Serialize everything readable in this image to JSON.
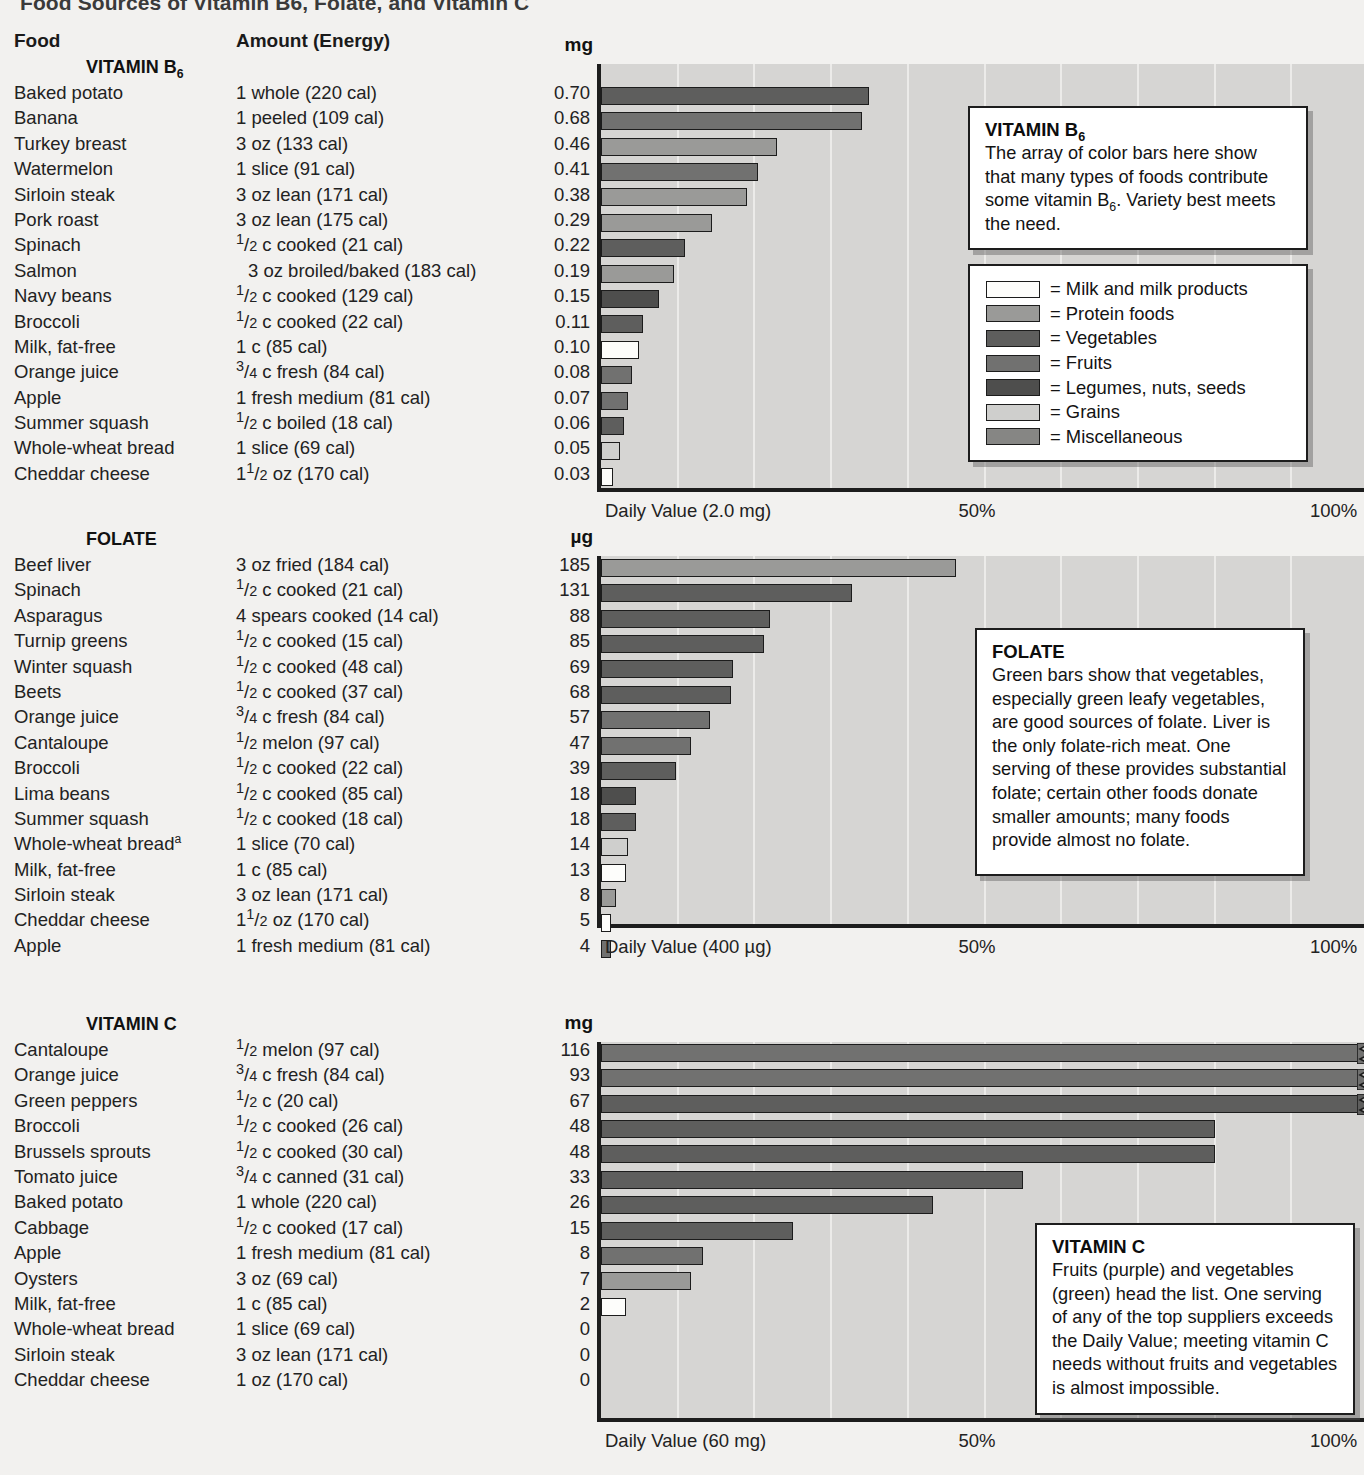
{
  "title": "Food Sources of Vitamin B6, Folate, and Vitamin C",
  "columns": {
    "food": "Food",
    "amount": "Amount (Energy)"
  },
  "colors": {
    "milk": "#fdfdfb",
    "protein": "#9a9a98",
    "vegetables": "#5e5e5d",
    "fruits": "#717170",
    "legumes": "#4e4e4d",
    "grains": "#cfcfcd",
    "misc": "#868684",
    "plot_bg": "#d6d5d3",
    "grid": "#ecebe9",
    "axis": "#1d1d1d"
  },
  "legend": {
    "items": [
      {
        "key": "milk",
        "label": "= Milk and milk products"
      },
      {
        "key": "protein",
        "label": "= Protein foods"
      },
      {
        "key": "vegetables",
        "label": "= Vegetables"
      },
      {
        "key": "fruits",
        "label": "= Fruits"
      },
      {
        "key": "legumes",
        "label": "= Legumes, nuts, seeds"
      },
      {
        "key": "grains",
        "label": "= Grains"
      },
      {
        "key": "misc",
        "label": "= Miscellaneous"
      }
    ]
  },
  "sections": [
    {
      "id": "b6",
      "group_title": "VITAMIN B6",
      "group_title_html": "VITAMIN B<sub>6</sub>",
      "unit": "mg",
      "daily_value_label": "Daily Value (2.0 mg)",
      "mid_label": "50%",
      "end_label": "100%",
      "callout": {
        "heading": "VITAMIN B6",
        "heading_html": "VITAMIN B<sub>6</sub>",
        "body": "The array of color bars here show that many types of foods contribute some vitamin B6. Variety best meets the need.",
        "body_html": "The array of color bars here show that many types of foods contribute some vitamin B<sub>6</sub>. Variety best meets the need."
      },
      "rows": [
        {
          "food": "Baked potato",
          "amount": "1 whole (220 cal)",
          "amount_html": "1 whole (220 cal)",
          "value": "0.70",
          "pct": 35.0,
          "cat": "vegetables"
        },
        {
          "food": "Banana",
          "amount": "1 peeled (109 cal)",
          "amount_html": "1 peeled (109 cal)",
          "value": "0.68",
          "pct": 34.0,
          "cat": "fruits"
        },
        {
          "food": "Turkey breast",
          "amount": "3 oz (133 cal)",
          "amount_html": "3 oz (133 cal)",
          "value": "0.46",
          "pct": 23.0,
          "cat": "protein"
        },
        {
          "food": "Watermelon",
          "amount": "1 slice (91 cal)",
          "amount_html": "1 slice (91 cal)",
          "value": "0.41",
          "pct": 20.5,
          "cat": "fruits"
        },
        {
          "food": "Sirloin steak",
          "amount": "3 oz lean (171 cal)",
          "amount_html": "3 oz lean (171 cal)",
          "value": "0.38",
          "pct": 19.0,
          "cat": "protein"
        },
        {
          "food": "Pork roast",
          "amount": "3 oz lean (175 cal)",
          "amount_html": "3 oz lean (175 cal)",
          "value": "0.29",
          "pct": 14.5,
          "cat": "protein"
        },
        {
          "food": "Spinach",
          "amount": "1/2 c cooked (21 cal)",
          "amount_html": "<span class=\"frac\"><span class=\"n\">1</span>/<span class=\"d\">2</span></span> c cooked (21 cal)",
          "value": "0.22",
          "pct": 11.0,
          "cat": "vegetables"
        },
        {
          "food": "Salmon",
          "amount": "3 oz broiled/baked (183 cal)",
          "amount_html": "3 oz broiled/baked (183 cal)",
          "indent": true,
          "value": "0.19",
          "pct": 9.5,
          "cat": "protein"
        },
        {
          "food": "Navy beans",
          "amount": "1/2 c cooked (129 cal)",
          "amount_html": "<span class=\"frac\"><span class=\"n\">1</span>/<span class=\"d\">2</span></span> c cooked (129 cal)",
          "value": "0.15",
          "pct": 7.5,
          "cat": "legumes"
        },
        {
          "food": "Broccoli",
          "amount": "1/2 c cooked (22 cal)",
          "amount_html": "<span class=\"frac\"><span class=\"n\">1</span>/<span class=\"d\">2</span></span> c cooked (22 cal)",
          "value": "0.11",
          "pct": 5.5,
          "cat": "vegetables"
        },
        {
          "food": "Milk, fat-free",
          "amount": "1 c (85 cal)",
          "amount_html": "1 c (85 cal)",
          "value": "0.10",
          "pct": 5.0,
          "cat": "milk"
        },
        {
          "food": "Orange juice",
          "amount": "3/4 c fresh (84 cal)",
          "amount_html": "<span class=\"frac\"><span class=\"n\">3</span>/<span class=\"d\">4</span></span> c fresh (84 cal)",
          "value": "0.08",
          "pct": 4.0,
          "cat": "fruits"
        },
        {
          "food": "Apple",
          "amount": "1 fresh medium (81 cal)",
          "amount_html": "1 fresh medium (81 cal)",
          "value": "0.07",
          "pct": 3.5,
          "cat": "fruits"
        },
        {
          "food": "Summer squash",
          "amount": "1/2 c boiled (18 cal)",
          "amount_html": "<span class=\"frac\"><span class=\"n\">1</span>/<span class=\"d\">2</span></span> c boiled (18 cal)",
          "value": "0.06",
          "pct": 3.0,
          "cat": "vegetables"
        },
        {
          "food": "Whole-wheat bread",
          "amount": "1 slice (69 cal)",
          "amount_html": "1 slice (69 cal)",
          "value": "0.05",
          "pct": 2.5,
          "cat": "grains"
        },
        {
          "food": "Cheddar cheese",
          "amount": "1 1/2 oz (170 cal)",
          "amount_html": "1<span class=\"frac\"><span class=\"n\">1</span>/<span class=\"d\">2</span></span> oz (170 cal)",
          "value": "0.03",
          "pct": 1.5,
          "cat": "milk"
        }
      ]
    },
    {
      "id": "folate",
      "group_title": "FOLATE",
      "group_title_html": "FOLATE",
      "unit": "µg",
      "daily_value_label": "Daily Value (400 µg)",
      "mid_label": "50%",
      "end_label": "100%",
      "callout": {
        "heading": "FOLATE",
        "heading_html": "FOLATE",
        "body": "Green bars show that vegetables, especially green leafy vegetables, are good sources of folate. Liver is the only folate-rich meat. One serving of these provides substantial folate; certain other foods donate smaller amounts; many foods provide almost no folate.",
        "body_html": "Green bars show that vegetables, especially green leafy vegetables, are good sources of folate. Liver is the only folate-rich meat. One serving of these provides substantial folate; certain other foods donate smaller amounts; many foods provide almost no folate."
      },
      "rows": [
        {
          "food": "Beef liver",
          "amount": "3 oz fried (184 cal)",
          "amount_html": "3 oz fried (184 cal)",
          "value": "185",
          "pct": 46.25,
          "cat": "protein"
        },
        {
          "food": "Spinach",
          "amount": "1/2 c cooked (21 cal)",
          "amount_html": "<span class=\"frac\"><span class=\"n\">1</span>/<span class=\"d\">2</span></span> c cooked (21 cal)",
          "value": "131",
          "pct": 32.75,
          "cat": "vegetables"
        },
        {
          "food": "Asparagus",
          "amount": "4 spears cooked (14 cal)",
          "amount_html": "4 spears cooked (14 cal)",
          "value": "88",
          "pct": 22.0,
          "cat": "vegetables"
        },
        {
          "food": "Turnip greens",
          "amount": "1/2 c cooked (15 cal)",
          "amount_html": "<span class=\"frac\"><span class=\"n\">1</span>/<span class=\"d\">2</span></span> c cooked (15 cal)",
          "value": "85",
          "pct": 21.25,
          "cat": "vegetables"
        },
        {
          "food": "Winter squash",
          "amount": "1/2 c cooked (48 cal)",
          "amount_html": "<span class=\"frac\"><span class=\"n\">1</span>/<span class=\"d\">2</span></span> c cooked (48 cal)",
          "value": "69",
          "pct": 17.25,
          "cat": "vegetables"
        },
        {
          "food": "Beets",
          "amount": "1/2 c cooked (37 cal)",
          "amount_html": "<span class=\"frac\"><span class=\"n\">1</span>/<span class=\"d\">2</span></span> c cooked (37 cal)",
          "value": "68",
          "pct": 17.0,
          "cat": "vegetables"
        },
        {
          "food": "Orange juice",
          "amount": "3/4 c fresh (84 cal)",
          "amount_html": "<span class=\"frac\"><span class=\"n\">3</span>/<span class=\"d\">4</span></span> c fresh (84 cal)",
          "value": "57",
          "pct": 14.25,
          "cat": "fruits"
        },
        {
          "food": "Cantaloupe",
          "amount": "1/2 melon (97 cal)",
          "amount_html": "<span class=\"frac\"><span class=\"n\">1</span>/<span class=\"d\">2</span></span> melon (97 cal)",
          "value": "47",
          "pct": 11.75,
          "cat": "fruits"
        },
        {
          "food": "Broccoli",
          "amount": "1/2 c cooked (22 cal)",
          "amount_html": "<span class=\"frac\"><span class=\"n\">1</span>/<span class=\"d\">2</span></span> c cooked (22 cal)",
          "value": "39",
          "pct": 9.75,
          "cat": "vegetables"
        },
        {
          "food": "Lima beans",
          "amount": "1/2 c cooked (85 cal)",
          "amount_html": "<span class=\"frac\"><span class=\"n\">1</span>/<span class=\"d\">2</span></span> c cooked (85 cal)",
          "value": "18",
          "pct": 4.5,
          "cat": "legumes"
        },
        {
          "food": "Summer squash",
          "amount": "1/2 c cooked (18 cal)",
          "amount_html": "<span class=\"frac\"><span class=\"n\">1</span>/<span class=\"d\">2</span></span> c cooked (18 cal)",
          "value": "18",
          "pct": 4.5,
          "cat": "vegetables"
        },
        {
          "food": "Whole-wheat bread",
          "food_html": "Whole-wheat bread<sup>a</sup>",
          "amount": "1 slice (70 cal)",
          "amount_html": "1 slice (70 cal)",
          "value": "14",
          "pct": 3.5,
          "cat": "grains"
        },
        {
          "food": "Milk, fat-free",
          "amount": "1 c (85 cal)",
          "amount_html": "1 c (85 cal)",
          "value": "13",
          "pct": 3.25,
          "cat": "milk"
        },
        {
          "food": "Sirloin steak",
          "amount": "3 oz lean (171 cal)",
          "amount_html": "3 oz lean (171 cal)",
          "value": "8",
          "pct": 2.0,
          "cat": "protein"
        },
        {
          "food": "Cheddar cheese",
          "amount": "1 1/2 oz (170 cal)",
          "amount_html": "1<span class=\"frac\"><span class=\"n\">1</span>/<span class=\"d\">2</span></span> oz (170 cal)",
          "value": "5",
          "pct": 1.25,
          "cat": "milk"
        },
        {
          "food": "Apple",
          "amount": "1 fresh medium (81 cal)",
          "amount_html": "1 fresh medium (81 cal)",
          "value": "4",
          "pct": 1.0,
          "cat": "fruits"
        }
      ]
    },
    {
      "id": "vitc",
      "group_title": "VITAMIN C",
      "group_title_html": "VITAMIN C",
      "unit": "mg",
      "daily_value_label": "Daily Value (60 mg)",
      "mid_label": "50%",
      "end_label": "100%",
      "callout": {
        "heading": "VITAMIN C",
        "heading_html": "VITAMIN C",
        "body": "Fruits (purple) and vegetables (green) head the list. One serving of any of the top suppliers exceeds the Daily Value; meeting vitamin C needs without fruits and vegetables is almost impossible.",
        "body_html": "Fruits (purple) and vegetables (green) head the list. One serving of any of the top suppliers exceeds the Daily Value; meeting vitamin C needs without fruits and vegetables is almost impossible."
      },
      "rows": [
        {
          "food": "Cantaloupe",
          "amount": "1/2 melon (97 cal)",
          "amount_html": "<span class=\"frac\"><span class=\"n\">1</span>/<span class=\"d\">2</span></span> melon (97 cal)",
          "value": "116",
          "pct": 104,
          "cat": "fruits",
          "broken": true
        },
        {
          "food": "Orange juice",
          "amount": "3/4 c fresh (84 cal)",
          "amount_html": "<span class=\"frac\"><span class=\"n\">3</span>/<span class=\"d\">4</span></span> c fresh (84 cal)",
          "value": "93",
          "pct": 104,
          "cat": "fruits",
          "broken": true
        },
        {
          "food": "Green peppers",
          "amount": "1/2 c (20 cal)",
          "amount_html": "<span class=\"frac\"><span class=\"n\">1</span>/<span class=\"d\">2</span></span> c (20 cal)",
          "value": "67",
          "pct": 104,
          "cat": "vegetables",
          "broken": true
        },
        {
          "food": "Broccoli",
          "amount": "1/2 c cooked (26 cal)",
          "amount_html": "<span class=\"frac\"><span class=\"n\">1</span>/<span class=\"d\">2</span></span> c cooked (26 cal)",
          "value": "48",
          "pct": 80.0,
          "cat": "vegetables"
        },
        {
          "food": "Brussels sprouts",
          "amount": "1/2 c cooked (30 cal)",
          "amount_html": "<span class=\"frac\"><span class=\"n\">1</span>/<span class=\"d\">2</span></span> c cooked (30 cal)",
          "value": "48",
          "pct": 80.0,
          "cat": "vegetables"
        },
        {
          "food": "Tomato  juice",
          "amount": "3/4 c canned (31 cal)",
          "amount_html": "<span class=\"frac\"><span class=\"n\">3</span>/<span class=\"d\">4</span></span> c canned (31 cal)",
          "value": "33",
          "pct": 55.0,
          "cat": "vegetables"
        },
        {
          "food": "Baked potato",
          "amount": "1 whole (220 cal)",
          "amount_html": "1 whole (220 cal)",
          "value": "26",
          "pct": 43.3,
          "cat": "vegetables"
        },
        {
          "food": "Cabbage",
          "amount": "1/2 c cooked (17 cal)",
          "amount_html": "<span class=\"frac\"><span class=\"n\">1</span>/<span class=\"d\">2</span></span> c cooked (17 cal)",
          "value": "15",
          "pct": 25.0,
          "cat": "vegetables"
        },
        {
          "food": "Apple",
          "amount": "1 fresh medium (81 cal)",
          "amount_html": "1 fresh medium (81 cal)",
          "value": "8",
          "pct": 13.3,
          "cat": "fruits"
        },
        {
          "food": "Oysters",
          "amount": "3 oz (69 cal)",
          "amount_html": "3 oz (69 cal)",
          "value": "7",
          "pct": 11.7,
          "cat": "protein"
        },
        {
          "food": "Milk, fat-free",
          "amount": "1 c (85 cal)",
          "amount_html": "1 c (85 cal)",
          "value": "2",
          "pct": 3.3,
          "cat": "milk"
        },
        {
          "food": "Whole-wheat bread",
          "amount": "1 slice (69 cal)",
          "amount_html": "1 slice (69 cal)",
          "value": "0",
          "pct": 0,
          "cat": "grains"
        },
        {
          "food": "Sirloin steak",
          "amount": "3 oz lean (171 cal)",
          "amount_html": "3 oz lean (171 cal)",
          "value": "0",
          "pct": 0,
          "cat": "protein"
        },
        {
          "food": "Cheddar cheese",
          "amount": "1 oz (170 cal)",
          "amount_html": "1 oz (170 cal)",
          "value": "0",
          "pct": 0,
          "cat": "milk"
        }
      ]
    }
  ]
}
